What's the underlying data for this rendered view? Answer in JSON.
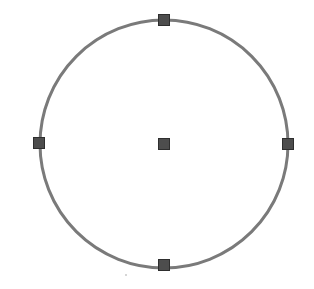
{
  "canvas": {
    "width": 314,
    "height": 289,
    "background": "#ffffff"
  },
  "circle": {
    "center": [
      164,
      144
    ],
    "radius": 124,
    "stroke_color": "#7a7a7a",
    "stroke_width": 3
  },
  "grips": {
    "size": 12,
    "fill_color": "#4d4d4d",
    "border_color": "#2e2e2e",
    "items": [
      {
        "name": "center",
        "x": 164,
        "y": 144
      },
      {
        "name": "quadrant-top",
        "x": 164,
        "y": 20
      },
      {
        "name": "quadrant-right",
        "x": 288,
        "y": 144
      },
      {
        "name": "quadrant-bottom",
        "x": 164,
        "y": 265
      },
      {
        "name": "quadrant-left",
        "x": 39,
        "y": 143
      }
    ]
  }
}
